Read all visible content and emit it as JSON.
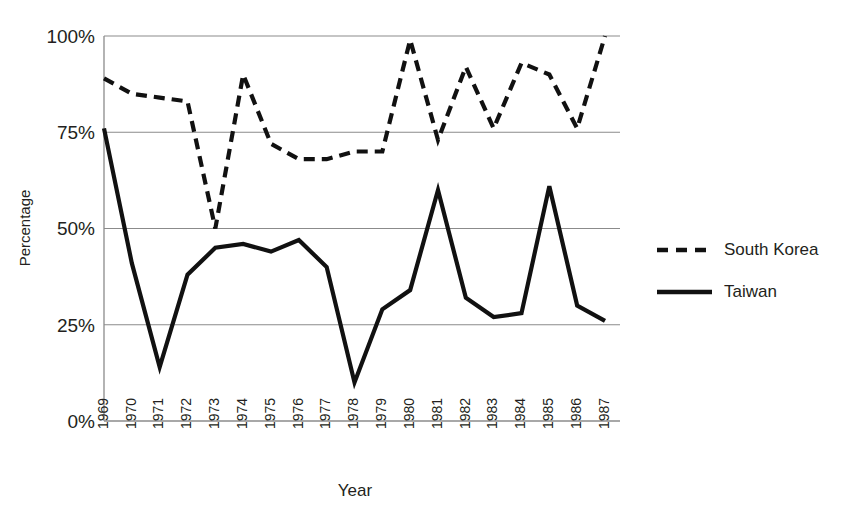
{
  "chart_data": {
    "type": "line",
    "title": "",
    "xlabel": "Year",
    "ylabel": "Percentage",
    "x": [
      1969,
      1970,
      1971,
      1972,
      1973,
      1974,
      1975,
      1976,
      1977,
      1978,
      1979,
      1980,
      1981,
      1982,
      1983,
      1984,
      1985,
      1986,
      1987
    ],
    "categories": [
      "1969",
      "1970",
      "1971",
      "1972",
      "1973",
      "1974",
      "1975",
      "1976",
      "1977",
      "1978",
      "1979",
      "1980",
      "1981",
      "1982",
      "1983",
      "1984",
      "1985",
      "1986",
      "1987"
    ],
    "series": [
      {
        "name": "South Korea",
        "style": "dashed",
        "color": "#111111",
        "values": [
          89,
          85,
          84,
          83,
          50,
          90,
          72,
          68,
          68,
          70,
          70,
          99,
          73,
          92,
          76,
          93,
          90,
          76,
          100
        ]
      },
      {
        "name": "Taiwan",
        "style": "solid",
        "color": "#111111",
        "values": [
          76,
          41,
          14,
          38,
          45,
          46,
          44,
          47,
          40,
          10,
          29,
          34,
          60,
          32,
          27,
          28,
          61,
          30,
          26
        ]
      }
    ],
    "ylim": [
      0,
      100
    ],
    "yticks": [
      0,
      25,
      50,
      75,
      100
    ],
    "ytick_labels": [
      "0%",
      "25%",
      "50%",
      "75%",
      "100%"
    ],
    "grid": true,
    "legend_position": "right"
  },
  "axes": {
    "y_label": "Percentage",
    "x_label": "Year",
    "y_ticks": [
      {
        "label": "100%"
      },
      {
        "label": "75%"
      },
      {
        "label": "50%"
      },
      {
        "label": "25%"
      },
      {
        "label": "0%"
      }
    ]
  },
  "legend": {
    "entries": [
      {
        "label": "South Korea",
        "style": "dashed"
      },
      {
        "label": "Taiwan",
        "style": "solid"
      }
    ]
  }
}
